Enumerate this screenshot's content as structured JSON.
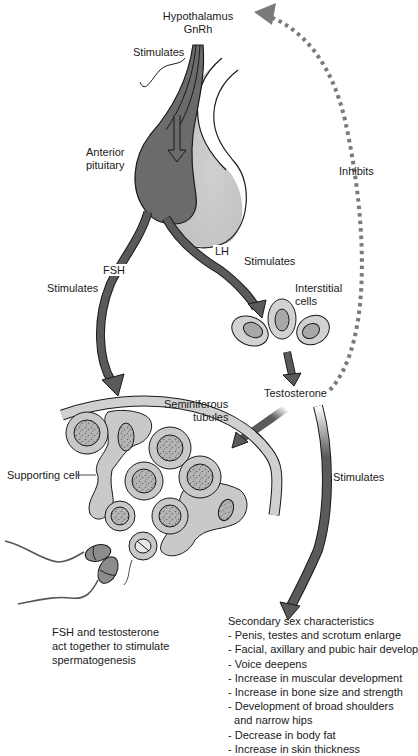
{
  "diagram": {
    "colors": {
      "arrow_dark": "#5a5a5a",
      "pituitary_anterior": "#6b6b6b",
      "pituitary_posterior": "#c8c8c8",
      "cell_fill": "#c9c9c9",
      "cell_nucleus": "#a8a8a8",
      "tubule_wall": "#d0d0d0",
      "inhibit_dots": "#7a7a7a",
      "outline": "#1a1a1a"
    },
    "labels": {
      "hypothalamus": "Hypothalamus",
      "gnrh": "GnRh",
      "stimulates_gnrh": "Stimulates",
      "anterior_pituitary_1": "Anterior",
      "anterior_pituitary_2": "pituitary",
      "inhibits": "Inhibits",
      "fsh": "FSH",
      "stimulates_fsh": "Stimulates",
      "lh": "LH",
      "stimulates_lh": "Stimulates",
      "interstitial_cells_1": "Interstitial",
      "interstitial_cells_2": "cells",
      "testosterone": "Testosterone",
      "seminiferous_1": "Seminiferous",
      "seminiferous_2": "tubules",
      "supporting_cell": "Supporting cell",
      "stimulates_secondary": "Stimulates"
    },
    "fsh_note": {
      "line1": "FSH and testosterone",
      "line2": "act together to stimulate",
      "line3": "spermatogenesis"
    },
    "secondary_sex": {
      "heading": "Secondary sex characteristics",
      "items": [
        "- Penis, testes and scrotum enlarge",
        "- Facial, axillary and pubic hair develop",
        "- Voice deepens",
        "- Increase in muscular development",
        "- Increase in bone size and strength",
        "- Development of broad shoulders",
        "  and narrow hips",
        "- Decrease in body fat",
        "- Increase in skin thickness"
      ]
    }
  }
}
